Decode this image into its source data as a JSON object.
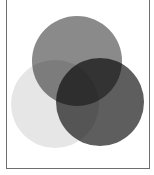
{
  "diagram": {
    "type": "venn",
    "set_count": 3,
    "blend": "multiply",
    "background": "#ffffff",
    "frame_color": "#6e6e6e",
    "circles": [
      {
        "name": "top-circle",
        "cx": 77,
        "cy": 61,
        "r": 45,
        "fill": "#8a8a8a"
      },
      {
        "name": "left-circle",
        "cx": 55,
        "cy": 104,
        "r": 44,
        "fill": "#e6e6e6"
      },
      {
        "name": "right-circle",
        "cx": 100,
        "cy": 102,
        "r": 44,
        "fill": "#5e5e5e"
      }
    ],
    "regions": {
      "top_only": "#8a8a8a",
      "left_only": "#e6e6e6",
      "right_only": "#5e5e5e",
      "top_left": "#7a7a7a",
      "left_right": "#565656",
      "top_right": "#1e1e1e",
      "all_three": "#050505"
    }
  }
}
